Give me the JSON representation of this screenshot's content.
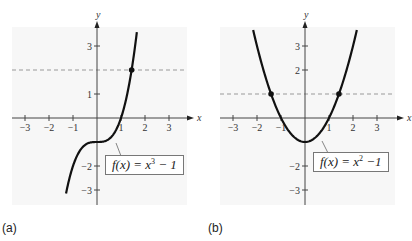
{
  "chart_data": [
    {
      "type": "line",
      "panel": "(a)",
      "title": "",
      "xlabel": "x",
      "ylabel": "y",
      "xlim": [
        -3.5,
        3.8
      ],
      "ylim": [
        -3.6,
        3.8
      ],
      "x_ticks": [
        -3,
        -2,
        -1,
        1,
        2,
        3
      ],
      "y_ticks": [
        -3,
        -2,
        1,
        3
      ],
      "x_tick_labels": [
        "−3",
        "−2",
        "−1",
        "1",
        "2",
        "3"
      ],
      "y_tick_labels": [
        "−3",
        "−2",
        "1",
        "3"
      ],
      "grid": false,
      "series": [
        {
          "name": "f(x) = x^3 − 1",
          "function": "x^3 - 1",
          "style": "solid"
        },
        {
          "name": "y = 2",
          "function": "2",
          "style": "dashed"
        }
      ],
      "points": [
        {
          "x": 1.442,
          "y": 2
        }
      ],
      "annotation": {
        "func": "f(x)",
        "eq": "= x",
        "exp": "3",
        "rest": " − 1"
      }
    },
    {
      "type": "line",
      "panel": "(b)",
      "title": "",
      "xlabel": "x",
      "ylabel": "y",
      "xlim": [
        -3.5,
        3.8
      ],
      "ylim": [
        -3.6,
        3.8
      ],
      "x_ticks": [
        -3,
        -2,
        -1,
        1,
        2,
        3
      ],
      "y_ticks": [
        -3,
        -2,
        2,
        3
      ],
      "x_tick_labels": [
        "−3",
        "−2",
        "−1",
        "1",
        "2",
        "3"
      ],
      "y_tick_labels": [
        "−3",
        "−2",
        "2",
        "3"
      ],
      "grid": false,
      "series": [
        {
          "name": "f(x) = x^2 − 1",
          "function": "x^2 - 1",
          "style": "solid"
        },
        {
          "name": "y = 1",
          "function": "1",
          "style": "dashed"
        }
      ],
      "points": [
        {
          "x": -1.414,
          "y": 1
        },
        {
          "x": 1.414,
          "y": 1
        }
      ],
      "annotation": {
        "func": "f(x)",
        "eq": "= x",
        "exp": "2",
        "rest": " −1"
      }
    }
  ],
  "labels": {
    "a": "(a)",
    "b": "(b)"
  },
  "axis": {
    "x": "x",
    "y": "y"
  }
}
